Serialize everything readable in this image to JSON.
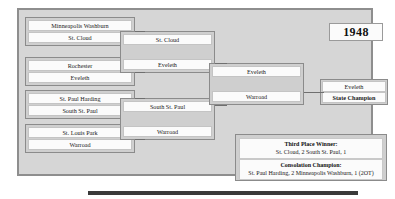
{
  "tournament": {
    "year": "1948"
  },
  "round1": {
    "matches": [
      {
        "top": "Minneapolis Washburn",
        "bottom": "St. Cloud"
      },
      {
        "top": "Rochester",
        "bottom": "Eveleth"
      },
      {
        "top": "St. Paul Harding",
        "bottom": "South St. Paul"
      },
      {
        "top": "St. Louis Park",
        "bottom": "Warroad"
      }
    ]
  },
  "round2": {
    "entries": [
      {
        "team": "St. Cloud"
      },
      {
        "team": "Eveleth"
      },
      {
        "team": "South St. Paul"
      },
      {
        "team": "Warroad"
      }
    ]
  },
  "round3": {
    "entries": [
      {
        "team": "Eveleth"
      },
      {
        "team": "Warroad"
      }
    ]
  },
  "champion": {
    "team": "Eveleth",
    "title": "State Champion"
  },
  "results": {
    "third_place": {
      "title": "Third Place Winner:",
      "score": "St. Cloud, 2  South St. Paul, 1"
    },
    "consolation": {
      "title": "Consolation Champion:",
      "score": "St. Paul Harding, 2  Minneapolis Washburn, 1 (2OT)"
    }
  }
}
